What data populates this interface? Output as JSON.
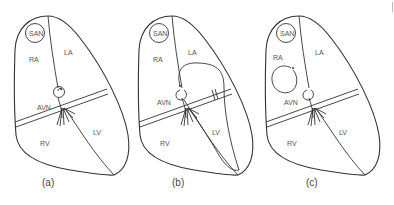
{
  "figure": {
    "panels": [
      {
        "id": "a",
        "caption": "(a)",
        "labels": {
          "san": "SAN",
          "ra": "RA",
          "la": "LA",
          "avn": "AVN",
          "rv": "RV",
          "lv": "LV"
        },
        "pathway": "re-entry loop within AV node"
      },
      {
        "id": "b",
        "caption": "(b)",
        "labels": {
          "san": "SAN",
          "ra": "RA",
          "la": "LA",
          "avn": "AVN",
          "rv": "RV",
          "lv": "LV"
        },
        "pathway": "accessory pathway loop through LV back to atrium"
      },
      {
        "id": "c",
        "caption": "(c)",
        "labels": {
          "san": "SAN",
          "ra": "RA",
          "la": "LA",
          "avn": "AVN",
          "rv": "RV",
          "lv": "LV"
        },
        "pathway": "circular re-entry loop within right atrium"
      }
    ],
    "colors": {
      "stroke": "#333333",
      "label": "#555555",
      "background": "#ffffff"
    }
  }
}
